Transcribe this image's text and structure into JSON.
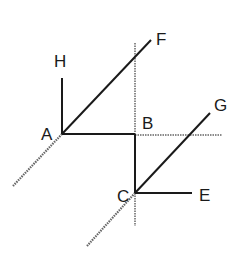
{
  "diagram": {
    "type": "geometry",
    "points": {
      "A": {
        "label": "A",
        "x": 62,
        "y": 134
      },
      "B": {
        "label": "B",
        "x": 135,
        "y": 134
      },
      "C": {
        "label": "C",
        "x": 135,
        "y": 193
      },
      "E": {
        "label": "E",
        "x": 192,
        "y": 193
      },
      "F": {
        "label": "F",
        "x": 151,
        "y": 40
      },
      "G": {
        "label": "G",
        "x": 210,
        "y": 113
      },
      "H": {
        "label": "H",
        "x": 62,
        "y": 78
      }
    },
    "solid_segments": [
      "AH",
      "AF",
      "AB",
      "BC",
      "CE",
      "CG"
    ],
    "dotted_lines": [
      "vertical through B and C",
      "horizontal extension of AB beyond B",
      "extension of FA beyond A",
      "extension of GC beyond C"
    ],
    "colors": {
      "line": "#1a1a1a",
      "dotted": "#555555"
    }
  }
}
